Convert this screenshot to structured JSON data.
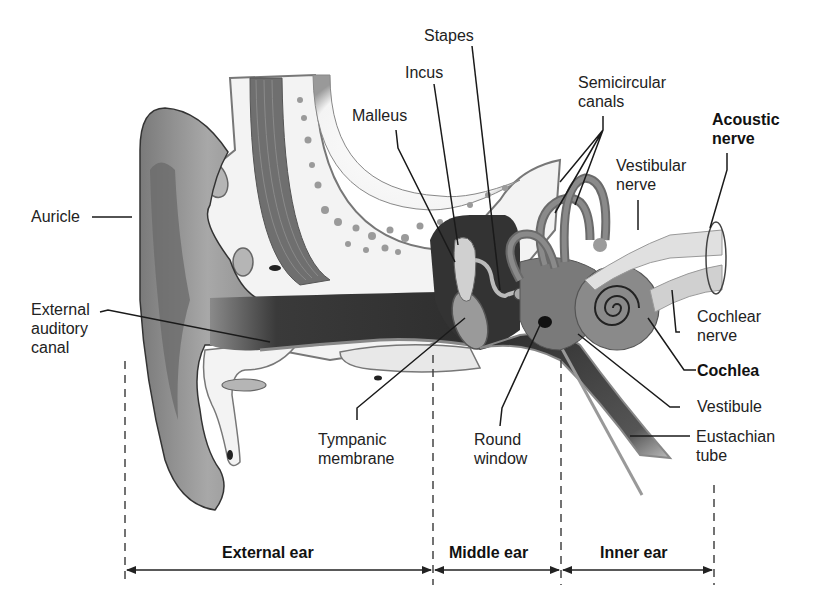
{
  "labels": {
    "auricle": "Auricle",
    "external_auditory_canal": [
      "External",
      "auditory",
      "canal"
    ],
    "malleus": "Malleus",
    "incus": "Incus",
    "stapes": "Stapes",
    "semicircular_canals": [
      "Semicircular",
      "canals"
    ],
    "acoustic_nerve": [
      "Acoustic",
      "nerve"
    ],
    "vestibular_nerve": [
      "Vestibular",
      "nerve"
    ],
    "cochlear_nerve": [
      "Cochlear",
      "nerve"
    ],
    "cochlea": "Cochlea",
    "vestibule": "Vestibule",
    "eustachian_tube": [
      "Eustachian",
      "tube"
    ],
    "tympanic_membrane": [
      "Tympanic",
      "membrane"
    ],
    "round_window": [
      "Round",
      "window"
    ]
  },
  "sections": {
    "external_ear": "External ear",
    "middle_ear": "Middle ear",
    "inner_ear": "Inner ear"
  },
  "colors": {
    "skin": "#8c8c8c",
    "skin_dark": "#6a6a6a",
    "bone": "#f2f2f2",
    "canal": "#3c3c3c",
    "ink": "#1a1a1a"
  }
}
